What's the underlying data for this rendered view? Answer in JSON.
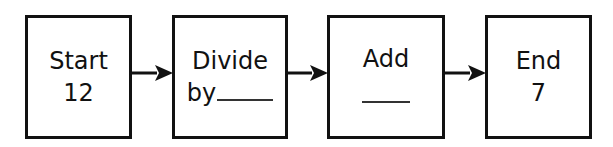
{
  "diagram": {
    "type": "flowchart",
    "direction": "left-to-right",
    "colors": {
      "stroke": "#111111",
      "background": "#ffffff",
      "blank_line": "#333333"
    },
    "nodes": [
      {
        "id": "start",
        "line1": "Start",
        "line2": "12"
      },
      {
        "id": "divide",
        "line1": "Divide",
        "line2": "by",
        "blank": true
      },
      {
        "id": "add",
        "line1": "Add",
        "line2": "",
        "blank": true
      },
      {
        "id": "end",
        "line1": "End",
        "line2": "7"
      }
    ],
    "edges": [
      {
        "from": "start",
        "to": "divide"
      },
      {
        "from": "divide",
        "to": "add"
      },
      {
        "from": "add",
        "to": "end"
      }
    ]
  }
}
